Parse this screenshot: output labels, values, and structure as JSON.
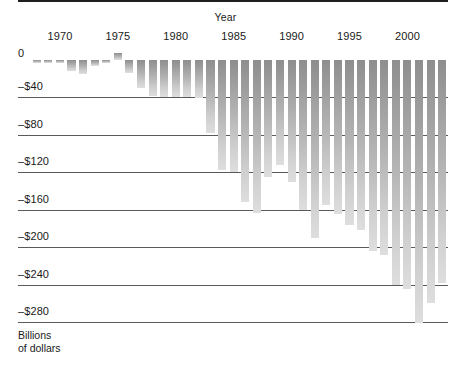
{
  "chart_data": {
    "type": "bar",
    "title": "",
    "xlabel": "Year",
    "ylabel": "Billions of dollars",
    "ylim": [
      -300,
      0
    ],
    "ytick_values": [
      0,
      -40,
      -80,
      -120,
      -160,
      -200,
      -240,
      -280
    ],
    "ytick_labels": [
      "0",
      "–$40",
      "–$80",
      "–$120",
      "–$160",
      "–$200",
      "–$240",
      "–$280"
    ],
    "xtick_labels": [
      "1970",
      "1975",
      "1980",
      "1985",
      "1990",
      "1995",
      "2000"
    ],
    "xtick_years": [
      1970,
      1975,
      1980,
      1985,
      1990,
      1995,
      2000
    ],
    "grid": true,
    "legend": false,
    "bar_color": "#b0b0b0",
    "axis_color": "#1f1f1f",
    "categories": [
      1968,
      1969,
      1970,
      1971,
      1972,
      1973,
      1974,
      1975,
      1976,
      1977,
      1978,
      1979,
      1980,
      1981,
      1982,
      1983,
      1984,
      1985,
      1986,
      1987,
      1988,
      1989,
      1990,
      1991,
      1992,
      1993,
      1994,
      1995,
      1996,
      1997,
      1998,
      1999,
      2000,
      2001,
      2002,
      2003
    ],
    "values": [
      -3,
      -3,
      -3,
      -12,
      -15,
      -6,
      -3,
      8,
      -14,
      -30,
      -38,
      -40,
      -40,
      -40,
      -41,
      -78,
      -118,
      -120,
      -152,
      -163,
      -125,
      -112,
      -130,
      -160,
      -190,
      -155,
      -165,
      -176,
      -182,
      -204,
      -208,
      -240,
      -245,
      -281,
      -260,
      -238
    ],
    "value_unit": "billions of dollars",
    "x_axis_title": "Year"
  },
  "axes": {
    "x_title": "Year",
    "y_unit_line1": "Billions",
    "y_unit_line2": "of dollars"
  }
}
